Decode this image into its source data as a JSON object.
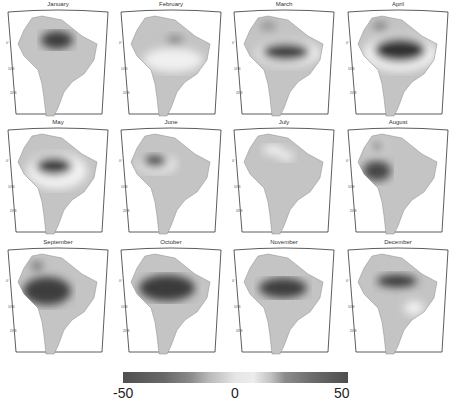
{
  "chart_data": {
    "type": "heatmap",
    "title": "",
    "layout": {
      "rows": 3,
      "cols": 4,
      "panel_type": "map of South America (monthly anomaly field)"
    },
    "panels": [
      {
        "title": "January",
        "feature": "strong negative center over NE Amazon near mouth",
        "min_est": -45
      },
      {
        "title": "February",
        "feature": "light positive band across central Brazil, weak negative near coast",
        "min_est": -20
      },
      {
        "title": "March",
        "feature": "strong negative band across central/eastern Amazon, positive halo",
        "min_est": -45
      },
      {
        "title": "April",
        "feature": "broad strong negative over central Amazon, positive halo",
        "min_est": -50
      },
      {
        "title": "May",
        "feature": "strong negative over central Amazon",
        "min_est": -45
      },
      {
        "title": "June",
        "feature": "negative center west-central Amazon",
        "min_est": -40
      },
      {
        "title": "July",
        "feature": "weak positive patches north, near neutral",
        "min_est": -10
      },
      {
        "title": "August",
        "feature": "negative over northern and western Amazon",
        "min_est": -40
      },
      {
        "title": "September",
        "feature": "strong negative over western/central Amazon",
        "min_est": -45
      },
      {
        "title": "October",
        "feature": "strong negative over central Amazon",
        "min_est": -50
      },
      {
        "title": "November",
        "feature": "negative over central-eastern Amazon",
        "min_est": -45
      },
      {
        "title": "December",
        "feature": "negative band along lower Amazon, positive SE Brazil",
        "min_est": -45
      }
    ],
    "colorbar": {
      "min": -50,
      "max": 50,
      "ticks": [
        -50,
        0,
        50
      ],
      "tick_labels": [
        "-50",
        "0",
        "50"
      ],
      "colormap": "grayscale diverging (dark at extremes, light at 0)"
    },
    "axis_labels": {
      "lat_ticks": [
        "0°",
        "10°S",
        "20°S"
      ],
      "lon_ticks": [
        "70°W",
        "60°W",
        "50°W"
      ]
    },
    "xlabel": "",
    "ylabel": ""
  },
  "colorbar": {
    "labels": [
      "-50",
      "0",
      "50"
    ]
  },
  "months": [
    "January",
    "February",
    "March",
    "April",
    "May",
    "June",
    "July",
    "August",
    "September",
    "October",
    "November",
    "December"
  ]
}
